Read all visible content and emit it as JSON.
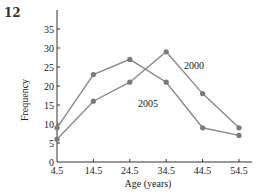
{
  "figure_label": "12",
  "chart_data": {
    "type": "line",
    "title": "",
    "xlabel": "Age (years)",
    "ylabel": "Frequency",
    "x": [
      4.5,
      14.5,
      24.5,
      34.5,
      44.5,
      54.5
    ],
    "x_tick_labels": [
      "4.5",
      "14.5",
      "24.5",
      "34.5",
      "44.5",
      "54.5"
    ],
    "y_ticks": [
      0,
      5,
      10,
      15,
      20,
      25,
      30,
      35
    ],
    "ylim": [
      0,
      40
    ],
    "grid": false,
    "legend_position": "inline labels",
    "series": [
      {
        "name": "2000",
        "values": [
          6,
          16,
          21,
          29,
          18,
          9
        ]
      },
      {
        "name": "2005",
        "values": [
          9,
          23,
          27,
          21,
          9,
          7
        ]
      }
    ],
    "colors": {
      "line": "#8a8a8a",
      "marker": "#7a7a7a",
      "axis": "#333333"
    }
  }
}
